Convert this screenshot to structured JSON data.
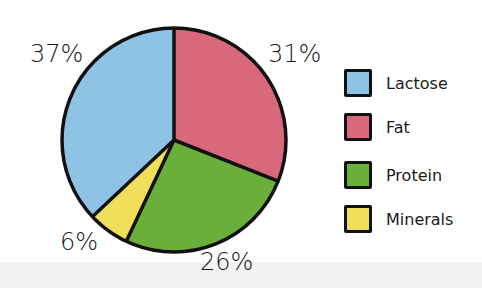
{
  "chart_data": {
    "type": "pie",
    "title": "",
    "categories": [
      "Lactose",
      "Fat",
      "Protein",
      "Minerals"
    ],
    "values": [
      37,
      31,
      26,
      6
    ],
    "unit": "%",
    "colors": {
      "Lactose": "#8ec3e6",
      "Fat": "#d9687c",
      "Protein": "#6aaf3a",
      "Minerals": "#f0df5a"
    },
    "slice_order_clockwise_from_top": [
      "Fat",
      "Protein",
      "Minerals",
      "Lactose"
    ],
    "data_labels": [
      "37%",
      "31%",
      "26%",
      "6%"
    ],
    "legend_position": "right"
  },
  "labels": {
    "lactose": "37%",
    "fat": "31%",
    "protein": "26%",
    "minerals": "6%"
  },
  "legend": [
    {
      "label": "Lactose",
      "color": "#8ec3e6"
    },
    {
      "label": "Fat",
      "color": "#d9687c"
    },
    {
      "label": "Protein",
      "color": "#6aaf3a"
    },
    {
      "label": "Minerals",
      "color": "#f0df5a"
    }
  ]
}
